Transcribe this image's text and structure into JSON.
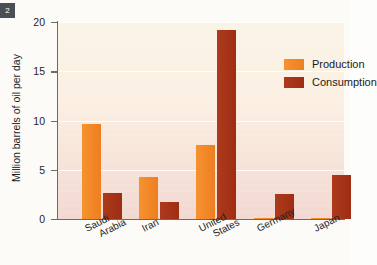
{
  "figure": {
    "badge_label": "2"
  },
  "chart_data": {
    "type": "bar",
    "title": "",
    "xlabel": "",
    "ylabel": "Million barrels of oil per day",
    "ylim": [
      0,
      20
    ],
    "yticks": [
      0,
      5,
      10,
      15,
      20
    ],
    "ytick_labels": [
      "0",
      "5",
      "10",
      "15",
      "20"
    ],
    "grid": true,
    "legend_position": "top-right",
    "categories": [
      "Saudi Arabia",
      "Iran",
      "United States",
      "Germany",
      "Japan"
    ],
    "category_lines": [
      [
        "Saudi",
        "Arabia"
      ],
      [
        "Iran"
      ],
      [
        "United",
        "States"
      ],
      [
        "Germany"
      ],
      [
        "Japan"
      ]
    ],
    "series": [
      {
        "name": "Production",
        "color": "#EF7E21",
        "values": [
          9.6,
          4.3,
          7.5,
          0.1,
          0.1
        ]
      },
      {
        "name": "Consumption",
        "color": "#A83218",
        "values": [
          2.6,
          1.7,
          19.2,
          2.5,
          4.5
        ]
      }
    ]
  }
}
